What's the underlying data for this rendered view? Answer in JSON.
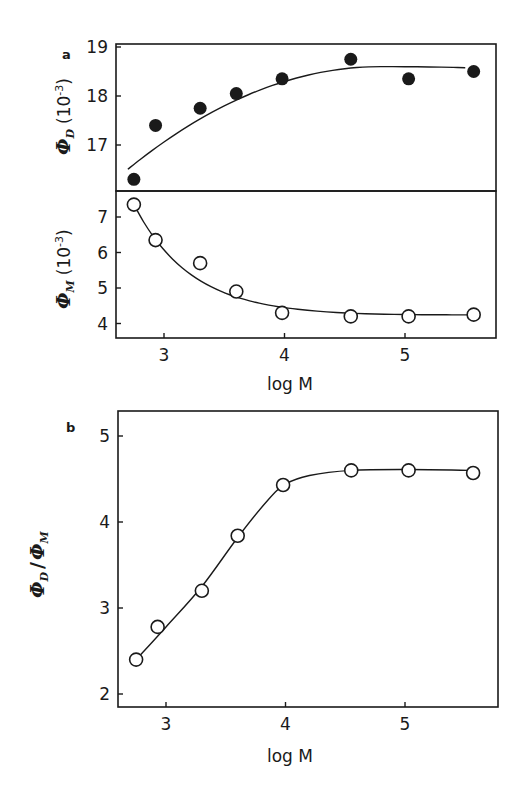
{
  "chart_data": [
    {
      "type": "scatter",
      "panel": "a (top)",
      "panel_label": "a",
      "ylabel": "Φ_D (10^-3)",
      "xlabel": "",
      "x": [
        2.75,
        2.93,
        3.3,
        3.6,
        3.98,
        4.55,
        5.03,
        5.57
      ],
      "values": [
        16.3,
        17.4,
        17.75,
        18.05,
        18.35,
        18.75,
        18.35,
        18.5
      ],
      "marker": "filled-circle",
      "fit_curve": true,
      "yticks": [
        "17",
        "18",
        "19"
      ],
      "ylim": [
        16.0,
        19.05
      ],
      "xlim": [
        2.6,
        5.75
      ]
    },
    {
      "type": "scatter",
      "panel": "a (middle)",
      "ylabel": "Φ_M (10^-3)",
      "xlabel": "log M",
      "x": [
        2.75,
        2.93,
        3.3,
        3.6,
        3.98,
        4.55,
        5.03,
        5.57
      ],
      "values": [
        7.35,
        6.35,
        5.7,
        4.9,
        4.3,
        4.2,
        4.2,
        4.25
      ],
      "marker": "open-circle",
      "fit_curve": true,
      "yticks": [
        "4",
        "5",
        "6",
        "7"
      ],
      "xticks": [
        "3",
        "4",
        "5"
      ],
      "ylim": [
        3.55,
        7.7
      ],
      "xlim": [
        2.6,
        5.75
      ]
    },
    {
      "type": "line",
      "panel": "b",
      "panel_label": "b",
      "ylabel": "Φ_D / Φ_M",
      "xlabel": "log M",
      "x": [
        2.75,
        2.93,
        3.3,
        3.6,
        3.98,
        4.55,
        5.03,
        5.57
      ],
      "values": [
        2.4,
        2.78,
        3.2,
        3.84,
        4.43,
        4.6,
        4.6,
        4.57
      ],
      "marker": "open-circle",
      "fit_curve": true,
      "yticks": [
        "2",
        "3",
        "4",
        "5"
      ],
      "xticks": [
        "3",
        "4",
        "5"
      ],
      "ylim": [
        1.85,
        5.3
      ],
      "xlim": [
        2.6,
        5.75
      ]
    }
  ],
  "labels": {
    "panel_a": "a",
    "panel_b": "b",
    "xlabel_top": "log M",
    "xlabel_bottom": "log M",
    "ylabel_phiD_sym": "Φ",
    "ylabel_phiD_sub": "D",
    "ylabel_phiD_unit": "(10",
    "ylabel_phiD_exp": "-3",
    "ylabel_phiD_close": ")",
    "ylabel_phiM_sym": "Φ",
    "ylabel_phiM_sub": "M",
    "ylabel_phiM_unit": "(10",
    "ylabel_phiM_exp": "-3",
    "ylabel_phiM_close": ")",
    "ylabel_ratio_num": "Φ",
    "ylabel_ratio_num_sub": "D",
    "ylabel_ratio_slash": "/",
    "ylabel_ratio_den": "Φ",
    "ylabel_ratio_den_sub": "M"
  },
  "ticks": {
    "top_y": [
      "17",
      "18",
      "19"
    ],
    "mid_y": [
      "4",
      "5",
      "6",
      "7"
    ],
    "mid_x": [
      "3",
      "4",
      "5"
    ],
    "b_y": [
      "2",
      "3",
      "4",
      "5"
    ],
    "b_x": [
      "3",
      "4",
      "5"
    ]
  }
}
